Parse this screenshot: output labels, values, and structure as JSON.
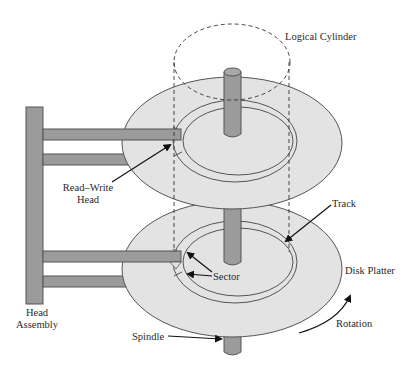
{
  "diagram": {
    "type": "disk-structure",
    "colors": {
      "background": "#ffffff",
      "platter_fill": "#e3e3e3",
      "platter_stroke": "#555555",
      "metal_fill": "#9b9b9b",
      "metal_stroke": "#555555",
      "line": "#222222"
    },
    "labels": {
      "logical_cylinder": "Logical Cylinder",
      "read_write_head_line1": "Read–Write",
      "read_write_head_line2": "Head",
      "track": "Track",
      "sector": "Sector",
      "disk_platter": "Disk Platter",
      "head_assembly_line1": "Head",
      "head_assembly_line2": "Assembly",
      "rotation": "Rotation",
      "spindle": "Spindle"
    },
    "components": [
      "logical-cylinder",
      "spindle",
      "top-platter",
      "bottom-platter",
      "track",
      "sector",
      "read-write-head",
      "head-assembly",
      "rotation-arrow"
    ]
  }
}
